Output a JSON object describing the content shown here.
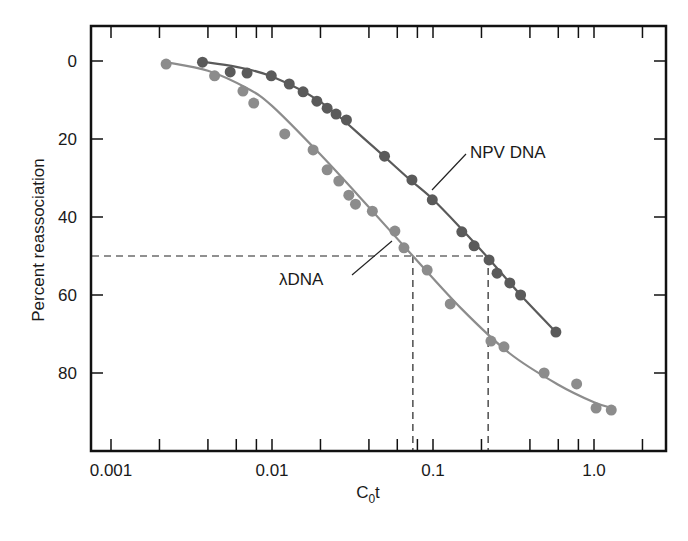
{
  "chart_data": {
    "type": "scatter",
    "subtype": "line-with-markers",
    "title": "",
    "xlabel": "C0t",
    "xlabel_parts": {
      "base": "C",
      "subscript": "0",
      "suffix": "t"
    },
    "ylabel": "Percent reassociation",
    "xscale": "log",
    "xlim": [
      0.00088,
      3.1
    ],
    "ylim": [
      -9,
      100
    ],
    "y_inverted": true,
    "grid": false,
    "legend": "inline labels",
    "x_ticks_major": [
      0.001,
      0.01,
      0.1,
      1.0
    ],
    "x_tick_labels": [
      "0.001",
      "0.01",
      "0.1",
      "1.0"
    ],
    "x_ticks_minor": [
      0.002,
      0.004,
      0.006,
      0.008,
      0.02,
      0.04,
      0.06,
      0.08,
      0.2,
      0.4,
      0.6,
      0.8,
      2.0
    ],
    "y_ticks": [
      0,
      20,
      40,
      60,
      80
    ],
    "y_tick_labels": [
      "0",
      "20",
      "40",
      "60",
      "80"
    ],
    "series": [
      {
        "name": "NPV DNA",
        "label": "NPV DNA",
        "color": "#5a5a5a",
        "x": [
          0.0037,
          0.0055,
          0.007,
          0.0099,
          0.0128,
          0.0156,
          0.019,
          0.022,
          0.025,
          0.029,
          0.05,
          0.074,
          0.099,
          0.151,
          0.18,
          0.223,
          0.25,
          0.3,
          0.35,
          0.58
        ],
        "y": [
          0.3,
          2.8,
          3.1,
          3.8,
          5.9,
          7.9,
          10.3,
          12.1,
          13.6,
          15.1,
          24.4,
          30.5,
          35.6,
          43.8,
          47.4,
          51.0,
          54.4,
          56.9,
          60.0,
          69.5
        ],
        "curve_x": [
          0.0037,
          0.006,
          0.01,
          0.02,
          0.04,
          0.07,
          0.1,
          0.15,
          0.22,
          0.35,
          0.58
        ],
        "curve_y": [
          0.2,
          1.5,
          4.0,
          10.5,
          21.0,
          30.0,
          35.5,
          43.0,
          50.5,
          60.0,
          69.5
        ]
      },
      {
        "name": "λ DNA",
        "label": "λDNA",
        "color": "#8c8c8c",
        "x": [
          0.0022,
          0.0044,
          0.0066,
          0.0077,
          0.012,
          0.018,
          0.022,
          0.026,
          0.03,
          0.033,
          0.042,
          0.058,
          0.066,
          0.092,
          0.128,
          0.229,
          0.276,
          0.49,
          0.78,
          1.03,
          1.28
        ],
        "y": [
          0.8,
          3.8,
          7.7,
          10.8,
          18.7,
          22.8,
          27.9,
          30.8,
          34.4,
          36.7,
          38.5,
          43.6,
          47.9,
          53.6,
          62.3,
          71.8,
          73.3,
          80.0,
          82.8,
          89.0,
          89.5
        ],
        "curve_x": [
          0.0022,
          0.004,
          0.007,
          0.01,
          0.02,
          0.04,
          0.075,
          0.15,
          0.3,
          0.6,
          1.0,
          1.3
        ],
        "curve_y": [
          0.3,
          2.5,
          7.0,
          11.5,
          24.0,
          37.5,
          50.0,
          63.5,
          75.0,
          83.0,
          87.5,
          89.0
        ]
      }
    ],
    "annotations": [
      {
        "type": "hline",
        "y": 50,
        "x_from": 0.00088,
        "x_to": 0.22,
        "style": "dashed"
      },
      {
        "type": "vline",
        "x": 0.075,
        "y_from": 50,
        "y_to": 100,
        "style": "dashed",
        "note": "λ DNA half-reassociation C0t"
      },
      {
        "type": "vline",
        "x": 0.22,
        "y_from": 50,
        "y_to": 100,
        "style": "dashed",
        "note": "NPV DNA half-reassociation C0t"
      },
      {
        "type": "label",
        "text": "NPV DNA",
        "points_to_series": "NPV DNA"
      },
      {
        "type": "label",
        "text": "λDNA",
        "points_to_series": "λ DNA"
      }
    ]
  },
  "labels": {
    "xlabel_base": "C",
    "xlabel_sub": "0",
    "xlabel_suffix": "t",
    "ylabel": "Percent reassociation",
    "npv_label": "NPV DNA",
    "lambda_label": "λDNA"
  }
}
